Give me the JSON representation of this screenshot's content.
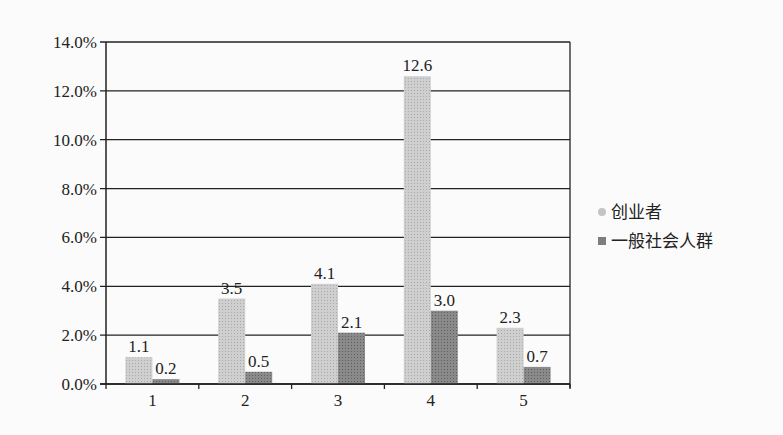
{
  "chart_data": {
    "type": "bar",
    "title": "",
    "xlabel": "",
    "ylabel": "",
    "categories": [
      "1",
      "2",
      "3",
      "4",
      "5"
    ],
    "series": [
      {
        "name": "创业者",
        "values": [
          1.1,
          3.5,
          4.1,
          12.6,
          2.3
        ],
        "color": "#c4c4c4"
      },
      {
        "name": "一般社会人群",
        "values": [
          0.2,
          0.5,
          2.1,
          3.0,
          0.7
        ],
        "color": "#7e7e7e"
      }
    ],
    "ylim": [
      0,
      14
    ],
    "yticks": [
      "0.0%",
      "2.0%",
      "4.0%",
      "6.0%",
      "8.0%",
      "10.0%",
      "12.0%",
      "14.0%"
    ],
    "data_labels": true,
    "grid": true,
    "legend_position": "right"
  },
  "legend": {
    "items": [
      {
        "label": "创业者"
      },
      {
        "label": "一般社会人群"
      }
    ]
  }
}
